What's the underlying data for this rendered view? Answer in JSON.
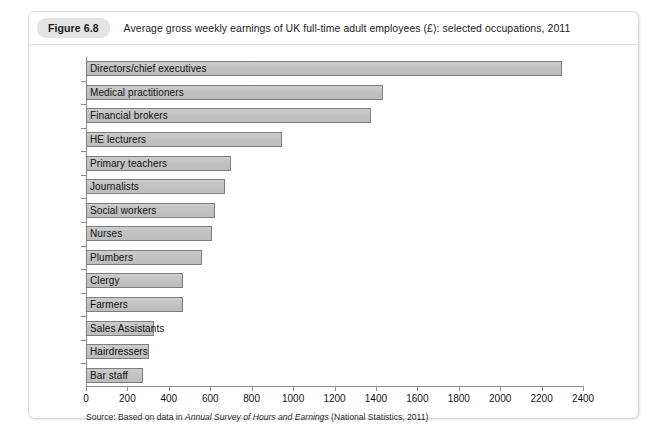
{
  "figure": {
    "badge": "Figure 6.8",
    "title": "Average gross weekly earnings of UK full-time adult employees (£): selected occupations, 2011",
    "source_prefix": "Source: Based on data in ",
    "source_italic": "Annual Survey of Hours and Earnings",
    "source_suffix": " (National Statistics, 2011)"
  },
  "colors": {
    "bar_fill": "#c3c3c3",
    "bar_border": "#7e7e7e",
    "badge_bg": "#e4e4e4",
    "axis": "#8c8c8c",
    "card_border": "#d8d8d8"
  },
  "chart_data": {
    "type": "bar",
    "orientation": "horizontal",
    "title": "Average gross weekly earnings of UK full-time adult employees (£): selected occupations, 2011",
    "xlabel": "",
    "ylabel": "",
    "xlim": [
      0,
      2400
    ],
    "xticks": [
      0,
      200,
      400,
      600,
      800,
      1000,
      1200,
      1400,
      1600,
      1800,
      2000,
      2200,
      2400
    ],
    "xtick_labels": [
      "0",
      "200",
      "400",
      "600",
      "800",
      "1000",
      "1200",
      "1400",
      "1600",
      "1800",
      "2000",
      "2200",
      "2400"
    ],
    "grid": false,
    "legend": false,
    "categories": [
      "Directors/chief executives",
      "Medical practitioners",
      "Financial brokers",
      "HE lecturers",
      "Primary teachers",
      "Journalists",
      "Social workers",
      "Nurses",
      "Plumbers",
      "Clergy",
      "Farmers",
      "Sales Assistants",
      "Hairdressers",
      "Bar staff"
    ],
    "values": [
      2300,
      1435,
      1375,
      945,
      700,
      670,
      625,
      608,
      560,
      468,
      468,
      330,
      305,
      275
    ]
  }
}
